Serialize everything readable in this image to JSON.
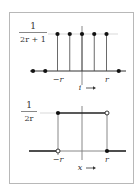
{
  "figure": {
    "top_panel": {
      "type": "discrete-uniform",
      "y_label": {
        "numerator": "1",
        "denominator": "2r + 1"
      },
      "ticks": {
        "left": "−r",
        "right": "r"
      },
      "x_label": "i",
      "arrow": "→",
      "impulse_positions": [
        -2,
        -1,
        0,
        1,
        2
      ],
      "zero_points": [
        -4,
        -3,
        3
      ]
    },
    "bottom_panel": {
      "type": "continuous-uniform",
      "y_label": {
        "numerator": "1",
        "denominator": "2r"
      },
      "ticks": {
        "left": "−r",
        "right": "r"
      },
      "x_label": "x",
      "arrow": "→",
      "left_endpoint": {
        "top": "filled",
        "bottom": "open"
      },
      "right_endpoint": {
        "top": "open",
        "bottom": "filled"
      }
    }
  },
  "colors": {
    "ink": "#222222",
    "frame": "#b8b8b8",
    "grid": "#cfcfcf"
  }
}
